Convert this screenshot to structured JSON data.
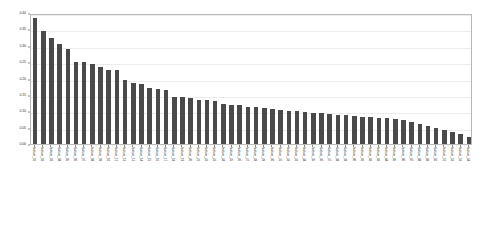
{
  "chart_data": {
    "type": "bar",
    "title": "",
    "subtitle": "",
    "xlabel": "",
    "ylabel": "",
    "ylim": [
      0.0,
      0.4
    ],
    "yticks": [
      "0.00",
      "0.05",
      "0.10",
      "0.15",
      "0.20",
      "0.25",
      "0.30",
      "0.35",
      "0.40"
    ],
    "ytick_values": [
      0.0,
      0.05,
      0.1,
      0.15,
      0.2,
      0.25,
      0.3,
      0.35,
      0.4
    ],
    "grid": true,
    "legend": null,
    "orientation": "vertical",
    "bar_color": "#4a4a4a",
    "sorted": "descending",
    "categories": [
      "feature_01",
      "feature_02",
      "feature_03",
      "feature_04",
      "feature_05",
      "feature_06",
      "feature_07",
      "feature_08",
      "feature_09",
      "feature_10",
      "feature_11",
      "feature_12",
      "feature_13",
      "feature_14",
      "feature_15",
      "feature_16",
      "feature_17",
      "feature_18",
      "feature_19",
      "feature_20",
      "feature_21",
      "feature_22",
      "feature_23",
      "feature_24",
      "feature_25",
      "feature_26",
      "feature_27",
      "feature_28",
      "feature_29",
      "feature_30",
      "feature_31",
      "feature_32",
      "feature_33",
      "feature_34",
      "feature_35",
      "feature_36",
      "feature_37",
      "feature_38",
      "feature_39",
      "feature_40",
      "feature_41",
      "feature_42",
      "feature_43",
      "feature_44",
      "feature_45",
      "feature_46",
      "feature_47",
      "feature_48",
      "feature_49",
      "feature_50",
      "feature_51",
      "feature_52",
      "feature_53",
      "feature_54"
    ],
    "values": [
      0.385,
      0.345,
      0.325,
      0.305,
      0.29,
      0.25,
      0.25,
      0.245,
      0.235,
      0.225,
      0.225,
      0.195,
      0.185,
      0.183,
      0.17,
      0.167,
      0.165,
      0.145,
      0.143,
      0.142,
      0.135,
      0.133,
      0.13,
      0.122,
      0.12,
      0.119,
      0.113,
      0.112,
      0.111,
      0.108,
      0.104,
      0.101,
      0.1,
      0.098,
      0.095,
      0.094,
      0.092,
      0.09,
      0.088,
      0.086,
      0.084,
      0.082,
      0.08,
      0.078,
      0.076,
      0.072,
      0.068,
      0.062,
      0.056,
      0.05,
      0.044,
      0.038,
      0.03,
      0.022
    ]
  }
}
